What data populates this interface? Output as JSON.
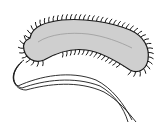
{
  "diagram": {
    "colors": {
      "background": "#ffffff",
      "cell_fill": "#cfcfcf",
      "outline": "#1a1a1a",
      "inner_line": "#9a9a9a"
    },
    "parts": [
      {
        "name": "cell-body",
        "label": ""
      },
      {
        "name": "pili",
        "label": ""
      },
      {
        "name": "flagella",
        "label": ""
      }
    ]
  }
}
